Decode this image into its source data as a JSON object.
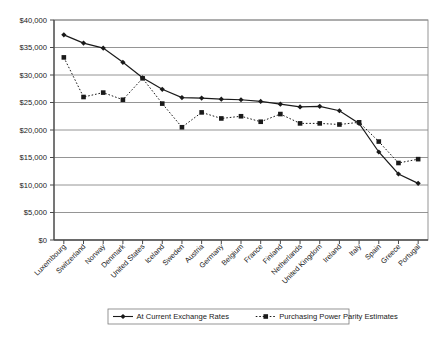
{
  "chart_data": {
    "type": "line",
    "title": "",
    "subtitle": "",
    "xlabel": "",
    "ylabel": "",
    "ylim": [
      0,
      40000
    ],
    "ytick_step": 5000,
    "grid": true,
    "legend_position": "bottom",
    "ytick_labels": [
      "$0",
      "$5,000",
      "$10,000",
      "$15,000",
      "$20,000",
      "$25,000",
      "$30,000",
      "$35,000",
      "$40,000"
    ],
    "ytick_values": [
      0,
      5000,
      10000,
      15000,
      20000,
      25000,
      30000,
      35000,
      40000
    ],
    "categories": [
      "Luxembourg",
      "Switzerland",
      "Norway",
      "Denmark",
      "United States",
      "Iceland",
      "Sweden",
      "Austria",
      "Germany",
      "Belgium",
      "France",
      "Finland",
      "Netherlands",
      "United Kingdom",
      "Ireland",
      "Italy",
      "Spain",
      "Greece",
      "Portugal"
    ],
    "series": [
      {
        "name": "At Current Exchange Rates",
        "marker": "diamond",
        "line_style": "solid",
        "color": "#1a1a1a",
        "values": [
          37300,
          35800,
          34900,
          32300,
          29500,
          27400,
          25900,
          25800,
          25600,
          25500,
          25200,
          24700,
          24200,
          24300,
          23500,
          21200,
          16000,
          12000,
          10300
        ]
      },
      {
        "name": "Purchasing Power Parity Estimates",
        "marker": "square",
        "line_style": "dotted",
        "color": "#1a1a1a",
        "values": [
          33200,
          26000,
          26800,
          25500,
          29400,
          24800,
          20500,
          23200,
          22100,
          22500,
          21500,
          22900,
          21200,
          21200,
          21000,
          21400,
          17900,
          14000,
          14700
        ]
      }
    ],
    "legend": [
      {
        "label": "At Current Exchange Rates",
        "marker": "diamond",
        "line_style": "solid"
      },
      {
        "label": "Purchasing Power Parity Estimates",
        "marker": "square",
        "line_style": "dotted"
      }
    ]
  }
}
